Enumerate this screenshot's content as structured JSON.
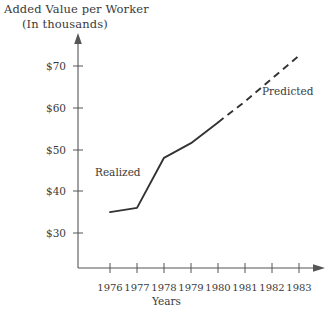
{
  "chart_data": {
    "type": "line",
    "title": "Added Value per Worker",
    "subtitle": "(In thousands)",
    "xlabel": "Years",
    "ylabel": "",
    "x": [
      1976,
      1977,
      1978,
      1979,
      1980,
      1981,
      1982,
      1983
    ],
    "categories": [
      "1976",
      "1977",
      "1978",
      "1979",
      "1980",
      "1981",
      "1982",
      "1983"
    ],
    "xlim": [
      1976,
      1983
    ],
    "ylim": [
      30,
      73
    ],
    "yticks": [
      30,
      40,
      50,
      60,
      70
    ],
    "ytick_labels": [
      "$30",
      "$40",
      "$50",
      "$60",
      "$70"
    ],
    "grid": false,
    "legend_position": "inline-annotations",
    "series": [
      {
        "name": "Realized",
        "style": "solid",
        "color": "#333333",
        "x": [
          1976,
          1977,
          1978,
          1979,
          1980
        ],
        "values": [
          35.0,
          36.0,
          48.0,
          51.5,
          56.5
        ]
      },
      {
        "name": "Predicted",
        "style": "dashed",
        "color": "#333333",
        "x": [
          1980,
          1981,
          1982,
          1983
        ],
        "values": [
          56.5,
          61.5,
          67.0,
          72.5
        ]
      }
    ],
    "annotations": [
      {
        "text": "Realized",
        "x": 1976.6,
        "y": 42.5
      },
      {
        "text": "Predicted",
        "x": 1982.1,
        "y": 62.0
      }
    ]
  },
  "axes": {
    "y_labels": [
      "$70",
      "$60",
      "$50",
      "$40",
      "$30"
    ],
    "x_labels": [
      "1976",
      "1977",
      "1978",
      "1979",
      "1980",
      "1981",
      "1982",
      "1983"
    ],
    "x_axis_title": "Years"
  },
  "titles": {
    "line1": "Added Value per Worker",
    "line2": "(In thousands)"
  },
  "series_labels": {
    "realized": "Realized",
    "predicted": "Predicted"
  },
  "colors": {
    "line": "#333333",
    "axis": "#555555",
    "text": "#3a3a3a",
    "background": "#ffffff"
  }
}
